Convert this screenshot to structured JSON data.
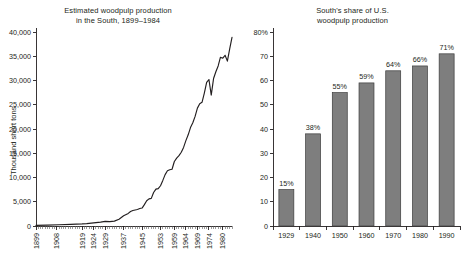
{
  "figure": {
    "background_color": "#ffffff",
    "text_color": "#231f20"
  },
  "chart_data": [
    {
      "type": "line",
      "panel": "left",
      "title": "Estimated woodpulp production\nin the South, 1899–1984",
      "title_line1": "Estimated woodpulp production",
      "title_line2": "in the South, 1899–1984",
      "xlabel": "",
      "ylabel": "Thousand short tons",
      "ylim": [
        0,
        40000
      ],
      "xlim": [
        1899,
        1984
      ],
      "grid": false,
      "legend": "none",
      "line_color": "#231f20",
      "ytick_labels": [
        "0",
        "5,000",
        "10,000",
        "15,000",
        "20,000",
        "25,000",
        "30,000",
        "35,000",
        "40,000"
      ],
      "ytick_values": [
        0,
        5000,
        10000,
        15000,
        20000,
        25000,
        30000,
        35000,
        40000
      ],
      "xtick_labels": [
        "1899",
        "1908",
        "1919",
        "1924",
        "1929",
        "1937",
        "1945",
        "1953",
        "1959",
        "1964",
        "1969",
        "1974",
        "1980"
      ],
      "xtick_values": [
        1899,
        1908,
        1919,
        1924,
        1929,
        1937,
        1945,
        1953,
        1959,
        1964,
        1969,
        1974,
        1980
      ],
      "x": [
        1899,
        1904,
        1909,
        1914,
        1919,
        1921,
        1923,
        1925,
        1927,
        1929,
        1931,
        1933,
        1935,
        1937,
        1939,
        1940,
        1941,
        1942,
        1943,
        1944,
        1945,
        1946,
        1947,
        1948,
        1949,
        1950,
        1951,
        1952,
        1953,
        1954,
        1955,
        1956,
        1957,
        1958,
        1959,
        1960,
        1961,
        1962,
        1963,
        1964,
        1965,
        1966,
        1967,
        1968,
        1969,
        1970,
        1971,
        1972,
        1973,
        1974,
        1975,
        1976,
        1977,
        1978,
        1979,
        1980,
        1981,
        1982,
        1983,
        1984
      ],
      "y": [
        120,
        180,
        260,
        340,
        430,
        500,
        600,
        700,
        800,
        950,
        900,
        1000,
        1400,
        2100,
        2600,
        3000,
        3200,
        3300,
        3400,
        3600,
        3700,
        4400,
        5200,
        5600,
        5700,
        6900,
        7600,
        7700,
        8300,
        9400,
        10600,
        11400,
        11600,
        11700,
        13300,
        14000,
        14500,
        15200,
        16200,
        17600,
        18800,
        20300,
        21300,
        22600,
        24300,
        25200,
        25500,
        27400,
        29600,
        30200,
        27000,
        30400,
        31800,
        33000,
        34800,
        34600,
        35200,
        34000,
        36500,
        38900
      ]
    },
    {
      "type": "bar",
      "panel": "right",
      "title": "South's share of U.S.\nwoodpulp production",
      "title_line1": "South's share of U.S.",
      "title_line2": "woodpulp production",
      "xlabel": "",
      "ylabel": "",
      "ylim": [
        0,
        80
      ],
      "grid": false,
      "legend": "none",
      "bar_color": "#7e7e7e",
      "bar_edge_color": "#3c3c3c",
      "ytick_labels": [
        "0",
        "10",
        "20",
        "30",
        "40",
        "50",
        "60",
        "70",
        "80%"
      ],
      "ytick_values": [
        0,
        10,
        20,
        30,
        40,
        50,
        60,
        70,
        80
      ],
      "categories": [
        "1929",
        "1940",
        "1950",
        "1960",
        "1970",
        "1980",
        "1990"
      ],
      "values": [
        15,
        38,
        55,
        59,
        64,
        66,
        71
      ],
      "value_labels": [
        "15%",
        "38%",
        "55%",
        "59%",
        "64%",
        "66%",
        "71%"
      ]
    }
  ]
}
